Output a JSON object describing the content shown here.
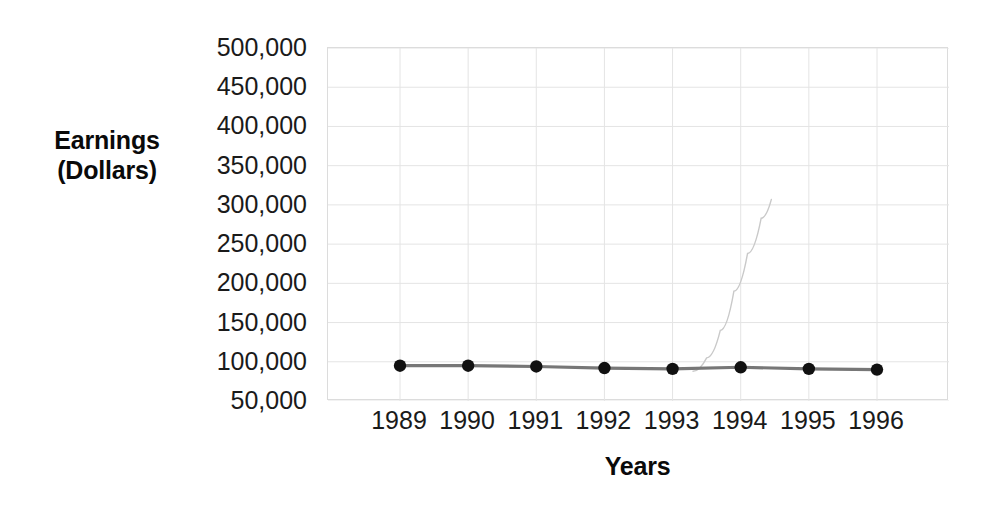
{
  "chart_data": {
    "type": "line",
    "title": "",
    "xlabel": "Years",
    "ylabel": "Earnings (Dollars)",
    "ylabel_lines": [
      "Earnings",
      "(Dollars)"
    ],
    "categories": [
      "1989",
      "1990",
      "1991",
      "1992",
      "1993",
      "1994",
      "1995",
      "1996"
    ],
    "x": [
      1989,
      1990,
      1991,
      1992,
      1993,
      1994,
      1995,
      1996
    ],
    "series": [
      {
        "name": "Earnings",
        "values": [
          95000,
          95000,
          94000,
          92000,
          91000,
          93000,
          91000,
          90000
        ],
        "marker": "circle",
        "marker_color": "#111111",
        "line_color": "#777777"
      },
      {
        "name": "faint-artifact-curve",
        "x": [
          1993.3,
          1993.5,
          1993.7,
          1993.9,
          1994.1,
          1994.3,
          1994.45
        ],
        "values": [
          88000,
          105000,
          140000,
          190000,
          238000,
          283000,
          307000
        ],
        "line_color": "#c9c9c9",
        "marker": "none"
      }
    ],
    "ylim": [
      50000,
      500000
    ],
    "ytick_values": [
      500000,
      450000,
      400000,
      350000,
      300000,
      250000,
      200000,
      150000,
      100000,
      50000
    ],
    "ytick_labels": [
      "500,000",
      "450,000",
      "400,000",
      "350,000",
      "300,000",
      "250,000",
      "200,000",
      "150,000",
      "100,000",
      "50,000"
    ],
    "xlim": [
      1989,
      1996
    ],
    "grid": true,
    "grid_color": "#e4e4e4",
    "legend": "none",
    "background": "#ffffff"
  }
}
